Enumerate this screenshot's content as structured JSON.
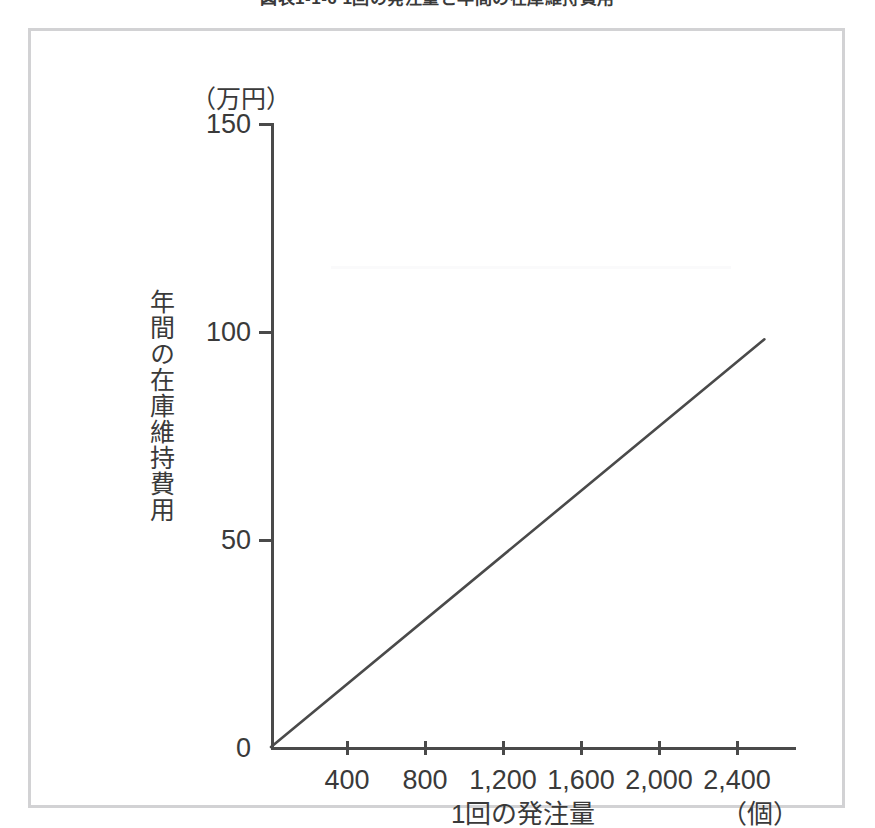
{
  "figure": {
    "title": "図表1-1-6 1回の発注量と年間の在庫維持費用",
    "title_clipped": true
  },
  "chart_data": {
    "type": "line",
    "title": "図表1-1-6 1回の発注量と年間の在庫維持費用",
    "xlabel": "1回の発注量",
    "ylabel": "年間の在庫維持費用",
    "x_unit": "（個）",
    "y_unit": "（万円）",
    "xlim": [
      0,
      2700
    ],
    "ylim": [
      0,
      150
    ],
    "grid": false,
    "legend": null,
    "x_ticks": [
      400,
      800,
      1200,
      1600,
      2000,
      2400
    ],
    "x_tick_labels": [
      "400",
      "800",
      "1,200",
      "1,600",
      "2,000",
      "2,400"
    ],
    "y_ticks": [
      0,
      50,
      100,
      150
    ],
    "y_tick_labels": [
      "0",
      "50",
      "100",
      "150"
    ],
    "series": [
      {
        "name": "年間の在庫維持費用",
        "color": "#4a4a4a",
        "x": [
          0,
          2530
        ],
        "values": [
          0,
          98
        ]
      }
    ],
    "annotations": []
  },
  "axes": {
    "y_unit_label": "（万円）",
    "y_title": "年間の在庫維持費用",
    "x_title": "1回の発注量",
    "x_unit_label": "（個）",
    "y_tick_labels": [
      "150",
      "100",
      "50",
      "0"
    ],
    "x_tick_labels": [
      "400",
      "800",
      "1,200",
      "1,600",
      "2,000",
      "2,400"
    ]
  },
  "colors": {
    "frame_border": "#d2d2d4",
    "axis": "#4a4a4a",
    "line": "#4a4a4a",
    "text": "#3a3a3a",
    "background": "#ffffff"
  }
}
